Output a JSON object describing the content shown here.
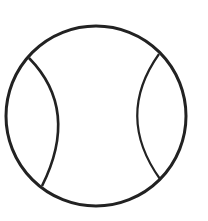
{
  "icon": {
    "name": "tennis-ball-icon",
    "stroke_color": "#222222",
    "background_color": "#ffffff"
  }
}
